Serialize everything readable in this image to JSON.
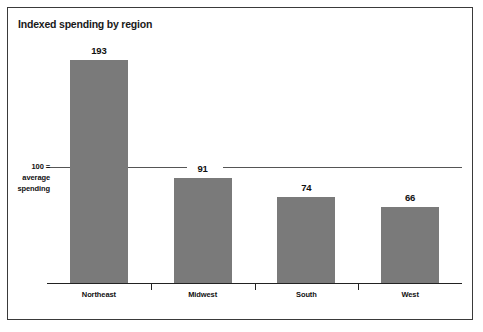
{
  "chart_data": {
    "type": "bar",
    "title": "Indexed spending by region",
    "xlabel": "",
    "ylabel": "",
    "categories": [
      "Northeast",
      "Midwest",
      "South",
      "West"
    ],
    "values": [
      193,
      91,
      74,
      66
    ],
    "value_labels": [
      "193",
      "91",
      "74",
      "66"
    ],
    "ylim": [
      0,
      210
    ],
    "grid": false,
    "legend": "none",
    "bar_color": "#7a7a7a",
    "reference_line": {
      "value": 100,
      "label_line1": "100 =",
      "label_line2": "average",
      "label_line3": "spending",
      "color": "#555555"
    }
  },
  "figure": {
    "title": "Indexed spending by region",
    "border_color": "#3a3a3a",
    "background": "#ffffff"
  }
}
